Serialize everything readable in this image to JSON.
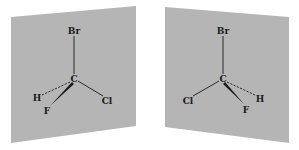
{
  "figure": {
    "colors": {
      "background": "#ffffff",
      "plane_fill": "#b5b5b5",
      "bond": "#1a1a1a",
      "label": "#1a1a1a"
    },
    "molecules": [
      {
        "id": "left",
        "center_atom": "C",
        "atoms": {
          "top": "Br",
          "center": "C",
          "dashed": "H",
          "wedge": "F",
          "plain": "Cl"
        }
      },
      {
        "id": "right",
        "center_atom": "C",
        "atoms": {
          "top": "Br",
          "center": "C",
          "dashed": "H",
          "wedge": "F",
          "plain": "Cl"
        }
      }
    ]
  }
}
